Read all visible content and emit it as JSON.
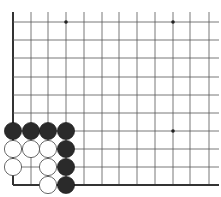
{
  "diagram": {
    "type": "go-board-fragment",
    "caption_partial": "",
    "grid": {
      "x_lines": [
        13,
        31,
        48,
        66,
        84,
        102,
        119,
        137,
        155,
        173,
        190,
        209
      ],
      "y_lines": [
        22,
        40,
        58,
        77,
        95,
        113,
        131,
        149,
        167,
        185
      ],
      "extend_top": 12,
      "extend_right": 219,
      "edges": [
        "left",
        "bottom"
      ],
      "line_color": "#555555",
      "edge_color": "#333333"
    },
    "star_points": [
      {
        "col": 3,
        "row": 0
      },
      {
        "col": 9,
        "row": 0
      },
      {
        "col": 9,
        "row": 6
      }
    ],
    "stones": [
      {
        "color": "black",
        "col": 0,
        "row": 6
      },
      {
        "color": "black",
        "col": 1,
        "row": 6
      },
      {
        "color": "black",
        "col": 2,
        "row": 6
      },
      {
        "color": "black",
        "col": 3,
        "row": 6
      },
      {
        "color": "white",
        "col": 0,
        "row": 7
      },
      {
        "color": "white",
        "col": 1,
        "row": 7
      },
      {
        "color": "white",
        "col": 2,
        "row": 7
      },
      {
        "color": "black",
        "col": 3,
        "row": 7
      },
      {
        "color": "white",
        "col": 0,
        "row": 8
      },
      {
        "color": "white",
        "col": 2,
        "row": 8
      },
      {
        "color": "black",
        "col": 3,
        "row": 8
      },
      {
        "color": "white",
        "col": 2,
        "row": 9
      },
      {
        "color": "black",
        "col": 3,
        "row": 9
      }
    ],
    "colors": {
      "black_stone": "#2a2a2a",
      "white_stone": "#ffffff",
      "white_outline": "#444444"
    }
  }
}
